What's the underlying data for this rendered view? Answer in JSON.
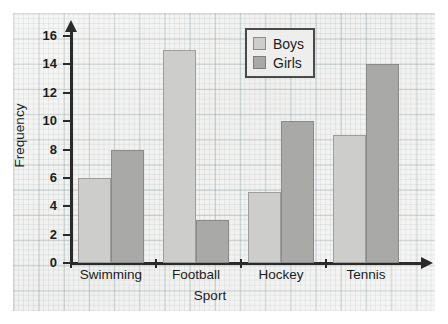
{
  "chart_data": {
    "type": "bar",
    "title": "",
    "xlabel": "Sport",
    "ylabel": "Frequency",
    "categories": [
      "Swimming",
      "Football",
      "Hockey",
      "Tennis"
    ],
    "series": [
      {
        "name": "Boys",
        "values": [
          6,
          15,
          5,
          9
        ],
        "color": "#cdcdcb"
      },
      {
        "name": "Girls",
        "values": [
          8,
          3,
          10,
          14
        ],
        "color": "#a9a9a7"
      }
    ],
    "ylim": [
      0,
      16
    ],
    "ytick_step": 2,
    "ytick_labels": [
      "16",
      "14",
      "12",
      "10",
      "8",
      "6",
      "4",
      "2",
      "0"
    ],
    "grid": "graph-paper",
    "legend_position": "top-right"
  },
  "legend": {
    "entries": [
      {
        "label": "Boys",
        "swatch": "boys-swatch"
      },
      {
        "label": "Girls",
        "swatch": "girls-swatch"
      }
    ]
  }
}
